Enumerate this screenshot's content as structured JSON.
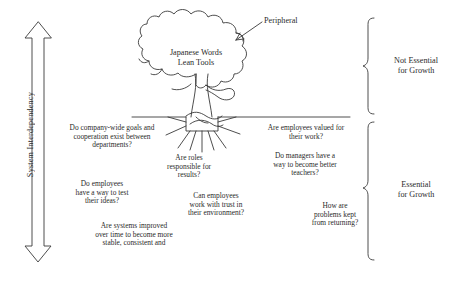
{
  "figure": {
    "background_color": "#ffffff",
    "stroke_color": "#3a3a3a",
    "text_color": "#2b2b2b"
  },
  "axis": {
    "label": "System Interdependency",
    "arrow": "double-headed-vertical-arrow"
  },
  "tree": {
    "canopy_lines": [
      "Japanese Words",
      "Lean Tools"
    ],
    "callout": {
      "label": "Peripheral",
      "points_to": "canopy"
    }
  },
  "brackets": [
    {
      "id": "not-essential",
      "lines": [
        "Not Essential",
        "for Growth"
      ]
    },
    {
      "id": "essential",
      "lines": [
        "Essential",
        "for Growth"
      ]
    }
  ],
  "root_questions": [
    {
      "id": "company-wide-goals",
      "lines": [
        "Do company-wide goals and",
        "cooperation exist between",
        "departments?"
      ]
    },
    {
      "id": "roles-responsible",
      "lines": [
        "Are roles",
        "responsible for",
        "results?"
      ]
    },
    {
      "id": "employees-valued",
      "lines": [
        "Are employees valued for",
        "their work?"
      ]
    },
    {
      "id": "managers-teachers",
      "lines": [
        "Do managers have a",
        "way to become better",
        "teachers?"
      ]
    },
    {
      "id": "test-ideas",
      "lines": [
        "Do employees",
        "have a way to test",
        "their ideas?"
      ]
    },
    {
      "id": "work-with-trust",
      "lines": [
        "Can employees",
        "work with trust in",
        "their environment?"
      ]
    },
    {
      "id": "problems-returning",
      "lines": [
        "How are",
        "problems kept",
        "from returning?"
      ]
    },
    {
      "id": "systems-improved",
      "lines": [
        "Are systems improved",
        "over time to become more",
        "stable, consistent and",
        "predictable?"
      ]
    }
  ]
}
